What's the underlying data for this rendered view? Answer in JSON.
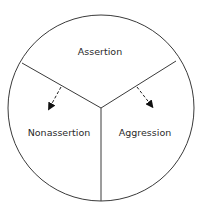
{
  "diagram": {
    "type": "pie-divided-circle",
    "segments": [
      {
        "label": "Assertion",
        "position": "top"
      },
      {
        "label": "Nonassertion",
        "position": "bottom-left"
      },
      {
        "label": "Aggression",
        "position": "bottom-right"
      }
    ],
    "arrows": [
      {
        "from": "Assertion",
        "to": "Nonassertion",
        "style": "dashed"
      },
      {
        "from": "Assertion",
        "to": "Aggression",
        "style": "dashed"
      }
    ],
    "colors": {
      "line": "#3a3a3a",
      "text": "#2a2a2a",
      "background": "#ffffff"
    }
  }
}
